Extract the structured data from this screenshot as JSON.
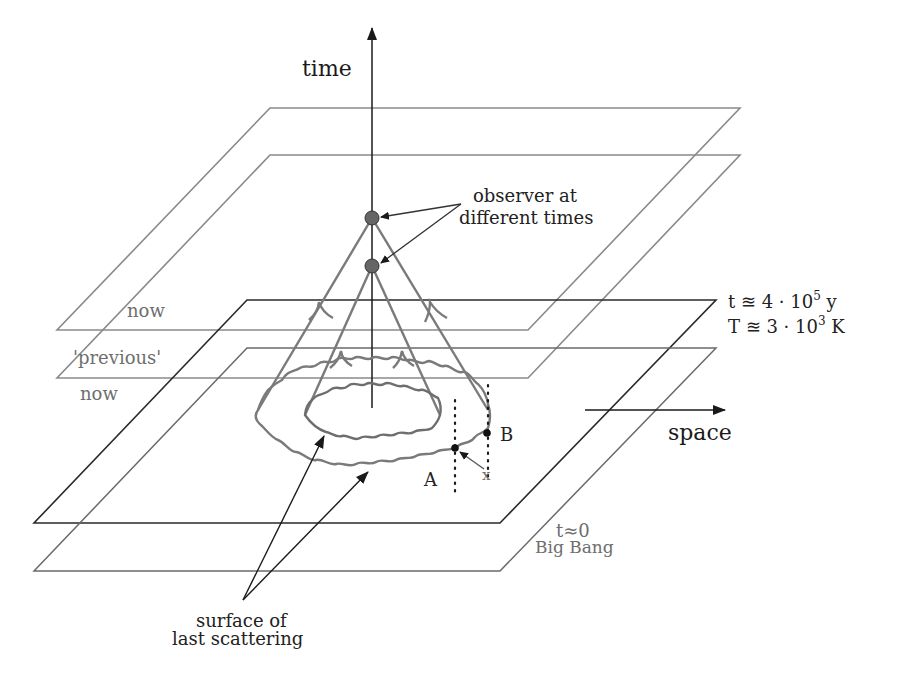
{
  "diagram": {
    "axes": {
      "time_label": "time",
      "space_label": "space"
    },
    "planes": [
      {
        "id": "now-top",
        "label": "now",
        "color": "#8a8a8a"
      },
      {
        "id": "previous-now",
        "label": "'previous'",
        "label2": "now",
        "color": "#8a8a8a"
      },
      {
        "id": "last-scattering",
        "label": "",
        "color": "#2a2a2a"
      },
      {
        "id": "big-bang",
        "label": "",
        "color": "#6a6a6a"
      }
    ],
    "annotations": {
      "observer_line1": "observer at",
      "observer_line2": "different times",
      "recomb_t_prefix": "t ≊ 4 · 10",
      "recomb_t_exp": "5",
      "recomb_t_unit": " y",
      "recomb_T_prefix": "T ≊ 3 · 10",
      "recomb_T_exp": "3",
      "recomb_T_unit": " K",
      "bigbang_t": "t≈0",
      "bigbang_label": "Big Bang",
      "surface_line1": "surface of",
      "surface_line2": "last scattering",
      "point_a": "A",
      "point_b": "B",
      "point_x": "x"
    },
    "colors": {
      "axis": "#1a1a1a",
      "cone": "#7a7a7a",
      "observer_dot": "#666666",
      "plane_light": "#8a8a8a",
      "plane_dark": "#2a2a2a"
    }
  }
}
